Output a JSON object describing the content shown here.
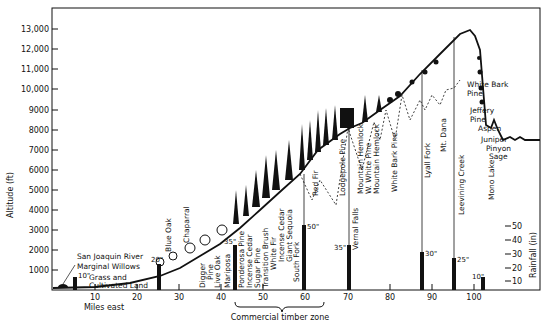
{
  "y_axis": {
    "label": "Altitude (ft)",
    "ticks": [
      {
        "value": 1000,
        "label": "1000"
      },
      {
        "value": 2000,
        "label": "2000"
      },
      {
        "value": 3000,
        "label": "3000"
      },
      {
        "value": 4000,
        "label": "4000"
      },
      {
        "value": 5000,
        "label": "5000"
      },
      {
        "value": 6000,
        "label": "6000"
      },
      {
        "value": 7000,
        "label": "7000"
      },
      {
        "value": 8000,
        "label": "8000"
      },
      {
        "value": 9000,
        "label": "9000"
      },
      {
        "value": 10000,
        "label": "10,000"
      },
      {
        "value": 11000,
        "label": "11,000"
      },
      {
        "value": 12000,
        "label": "12,000"
      },
      {
        "value": 13000,
        "label": "13,000"
      }
    ]
  },
  "x_axis": {
    "label": "Miles east",
    "ticks": [
      {
        "value": 10,
        "label": "10"
      },
      {
        "value": 20,
        "label": "20"
      },
      {
        "value": 30,
        "label": "30"
      },
      {
        "value": 40,
        "label": "40"
      },
      {
        "value": 50,
        "label": "50"
      },
      {
        "value": 60,
        "label": "60"
      },
      {
        "value": 70,
        "label": "70"
      },
      {
        "value": 80,
        "label": "80"
      },
      {
        "value": 90,
        "label": "90"
      },
      {
        "value": 100,
        "label": "100"
      }
    ]
  },
  "rainfall_axis": {
    "label": "Rainfall (in)",
    "ticks": [
      {
        "value": 10,
        "label": "10"
      },
      {
        "value": 20,
        "label": "20"
      },
      {
        "value": 30,
        "label": "30"
      },
      {
        "value": 40,
        "label": "40"
      },
      {
        "value": 50,
        "label": "50"
      }
    ]
  },
  "timber_zone": {
    "label": "Commercial timber zone",
    "from_mile": 43,
    "to_mile": 65
  },
  "rainfall_bars": [
    {
      "mile": 5,
      "inches": 10,
      "label": "10\""
    },
    {
      "mile": 25,
      "inches": 20,
      "label": "20\""
    },
    {
      "mile": 43,
      "inches": 35,
      "label": "35\""
    },
    {
      "mile": 60,
      "inches": 50,
      "label": "50\""
    },
    {
      "mile": 71.5,
      "inches": 35,
      "label": "35\""
    },
    {
      "mile": 88.5,
      "inches": 30,
      "label": "30\""
    },
    {
      "mile": 96,
      "inches": 25,
      "label": "25\""
    },
    {
      "mile": 103,
      "inches": 10,
      "label": "10\""
    }
  ],
  "place_labels": [
    {
      "text": "Mariposa",
      "mile": 41
    },
    {
      "text": "South Fork",
      "mile": 58
    },
    {
      "text": "Vernal Falls",
      "mile": 73
    },
    {
      "text": "Lyall Fork",
      "mile": 90
    },
    {
      "text": "Mt. Dana",
      "mile": 95
    },
    {
      "text": "Leevining Creek",
      "mile": 99
    },
    {
      "text": "Mono Lake",
      "mile": 104
    }
  ],
  "vegetation_labels_west": [
    {
      "text": "San Joaquin River"
    },
    {
      "text": "Marginal Willows"
    },
    {
      "text": "Grass and"
    },
    {
      "text": "Cultivated Land"
    }
  ],
  "vegetation_labels_vertical": [
    {
      "text": "Blue Oak"
    },
    {
      "text": "Chaparral"
    },
    {
      "text": "Digger"
    },
    {
      "text": "Pine"
    },
    {
      "text": "Live Oak"
    },
    {
      "text": "Ponderosa Pine"
    },
    {
      "text": "Incense Cedar"
    },
    {
      "text": "Sugar Pine"
    },
    {
      "text": "Transition Brush"
    },
    {
      "text": "White Fir"
    },
    {
      "text": "Incense Cedar"
    },
    {
      "text": "Giant Sequoia"
    },
    {
      "text": "Red Fir"
    },
    {
      "text": "Lodgepole Pine"
    },
    {
      "text": "Mountain Hemlock"
    },
    {
      "text": "W. White Pine"
    },
    {
      "text": "Mountain Hemlock"
    },
    {
      "text": "White Bark Pine"
    }
  ],
  "vegetation_labels_east": [
    {
      "text": "White Bark"
    },
    {
      "text": "Pine"
    },
    {
      "text": "Jeffery"
    },
    {
      "text": "Pine"
    },
    {
      "text": "Aspen"
    },
    {
      "text": "Juniper"
    },
    {
      "text": "Pinyon"
    },
    {
      "text": "Sage"
    }
  ]
}
